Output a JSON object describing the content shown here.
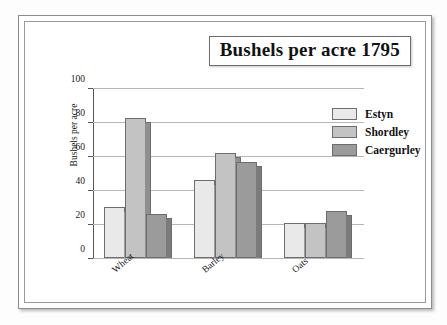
{
  "chart_data": {
    "type": "bar",
    "title": "Bushels per acre 1795",
    "xlabel": "",
    "ylabel": "Bushels per acre",
    "categories": [
      "Wheat",
      "Barley",
      "Oats"
    ],
    "series": [
      {
        "name": "Estyn",
        "color": "#e9e9e9",
        "values": [
          30,
          46,
          20.5
        ]
      },
      {
        "name": "Shordley",
        "color": "#c3c3c3",
        "values": [
          83,
          62,
          20.5
        ]
      },
      {
        "name": "Caergurley",
        "color": "#9b9b9b",
        "values": [
          26,
          57,
          28
        ]
      }
    ],
    "ylim": [
      0,
      100
    ],
    "yticks": [
      0,
      20,
      40,
      60,
      80,
      100
    ],
    "ytick_labels": [
      "0",
      "20",
      "40",
      "60",
      "80",
      "100"
    ],
    "grid": true,
    "legend_position": "top-right",
    "bar_style": "3d-shadow"
  }
}
